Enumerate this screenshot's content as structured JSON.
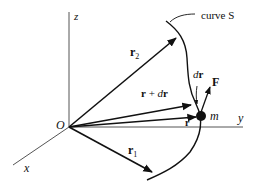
{
  "diagram": {
    "title": "",
    "axes": {
      "x": {
        "label": "x"
      },
      "y": {
        "label": "y"
      },
      "z": {
        "label": "z"
      }
    },
    "origin": {
      "label": "O"
    },
    "curve": {
      "label": "curve S"
    },
    "mass": {
      "label": "m"
    },
    "vectors": {
      "r2": {
        "label_main": "r",
        "label_sub": "2"
      },
      "r_plus_dr": {
        "label": "r + dr",
        "label_r": "r",
        "label_plus": " + ",
        "label_d": "d",
        "label_r2": "r"
      },
      "r": {
        "label": "r"
      },
      "r1": {
        "label_main": "r",
        "label_sub": "1"
      },
      "dr": {
        "label_d": "d",
        "label_r": "r"
      },
      "F_upper": {
        "label": "F"
      },
      "F_lower": {
        "label": "F"
      }
    },
    "colors": {
      "ink": "#111111",
      "axis": "#555555",
      "background": "#ffffff"
    }
  }
}
